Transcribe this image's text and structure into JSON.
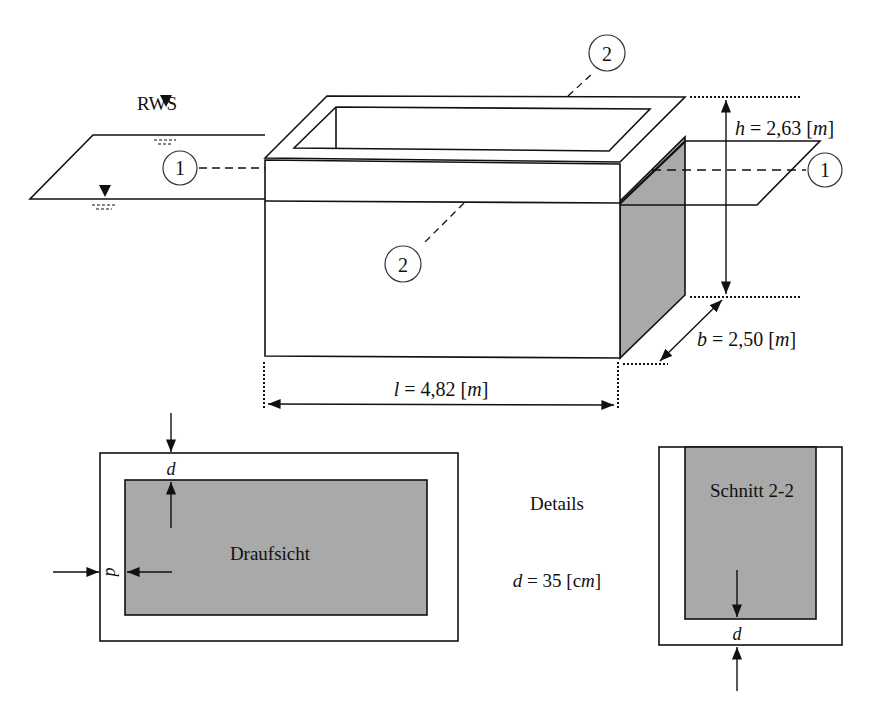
{
  "water": {
    "label": "RWS"
  },
  "markers": {
    "section1": "1",
    "section2": "2"
  },
  "dimensions": {
    "h_var": "h",
    "h_val": " = 2,63 [",
    "h_unit": "m",
    "h_close": "]",
    "b_var": "b",
    "b_val": " = 2,50 [",
    "b_unit": "m",
    "b_close": "]",
    "l_var": "l",
    "l_val": " = 4,82 [",
    "l_unit": "m",
    "l_close": "]"
  },
  "plan_view": {
    "title": "Draufsicht",
    "d_label": "d"
  },
  "details": {
    "title": "Details",
    "d_var": "d",
    "d_val": " = 35 [c",
    "d_unit": "m",
    "d_close": "]"
  },
  "section_view": {
    "title": "Schnitt 2-2",
    "d_label": "d"
  },
  "colors": {
    "line": "#111111",
    "fill_gray": "#a9a9a9",
    "background": "#ffffff"
  }
}
